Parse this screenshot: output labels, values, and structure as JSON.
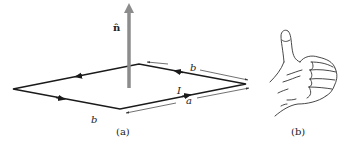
{
  "figure": {
    "panel_a": {
      "caption": "(a)",
      "normal_label": "n̂",
      "side_labels": {
        "back_right": "b",
        "front_right": "a",
        "front_left": "b"
      },
      "current_label": "I",
      "loop_color": "#1a1a1a",
      "normal_color": "#8c8c8c"
    },
    "panel_b": {
      "caption": "(b)",
      "description": "right-hand thumbs-up"
    }
  }
}
